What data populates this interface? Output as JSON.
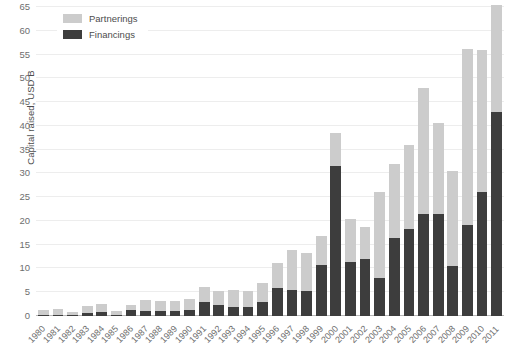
{
  "chart_data": {
    "type": "bar",
    "stacked": true,
    "title": "",
    "xlabel": "",
    "ylabel": "Capital raised, USD B",
    "ylim": [
      0,
      65
    ],
    "ytick_step": 5,
    "grid": true,
    "legend_position": "top-left",
    "categories": [
      "1980",
      "1981",
      "1982",
      "1983",
      "1984",
      "1985",
      "1986",
      "1987",
      "1988",
      "1989",
      "1990",
      "1991",
      "1992",
      "1993",
      "1994",
      "1995",
      "1996",
      "1997",
      "1998",
      "1999",
      "2000",
      "2001",
      "2002",
      "2003",
      "2004",
      "2005",
      "2006",
      "2007",
      "2008",
      "2009",
      "2010",
      "2011"
    ],
    "series": [
      {
        "name": "Financings",
        "color": "#3d3d3d",
        "values": [
          0.2,
          0.3,
          0.2,
          0.6,
          0.9,
          0.3,
          1.2,
          1.1,
          1.0,
          1.0,
          1.2,
          2.9,
          2.4,
          2.0,
          2.0,
          3.0,
          5.9,
          5.5,
          5.2,
          10.8,
          31.5,
          11.4,
          11.9,
          8.0,
          16.4,
          18.2,
          21.5,
          21.4,
          10.6,
          19.2,
          26.0,
          43.0
        ]
      },
      {
        "name": "Partnerings",
        "color": "#cccccc",
        "values": [
          1.0,
          1.1,
          0.6,
          1.5,
          1.6,
          0.7,
          1.2,
          2.2,
          2.1,
          2.2,
          2.3,
          3.2,
          2.8,
          3.4,
          3.2,
          4.0,
          5.2,
          8.3,
          8.0,
          6.0,
          7.0,
          9.1,
          6.8,
          18.0,
          15.6,
          17.8,
          26.5,
          19.2,
          20.0,
          37.0,
          30.0,
          22.5
        ]
      }
    ],
    "totals": [
      1.2,
      1.4,
      0.8,
      2.1,
      2.5,
      1.0,
      2.4,
      3.3,
      3.1,
      3.2,
      3.5,
      6.1,
      5.2,
      5.4,
      5.2,
      7.0,
      11.1,
      13.8,
      13.2,
      16.8,
      38.5,
      20.5,
      18.7,
      26.0,
      32.0,
      36.0,
      48.0,
      40.6,
      30.6,
      56.2,
      56.0,
      65.5
    ],
    "ytick_labels": [
      "0",
      "5",
      "10",
      "15",
      "20",
      "25",
      "30",
      "35",
      "40",
      "45",
      "50",
      "55",
      "60",
      "65"
    ]
  },
  "legend": {
    "items": [
      {
        "label": "Partnerings",
        "swatch": "partnerings"
      },
      {
        "label": "Financings",
        "swatch": "financings"
      }
    ]
  }
}
